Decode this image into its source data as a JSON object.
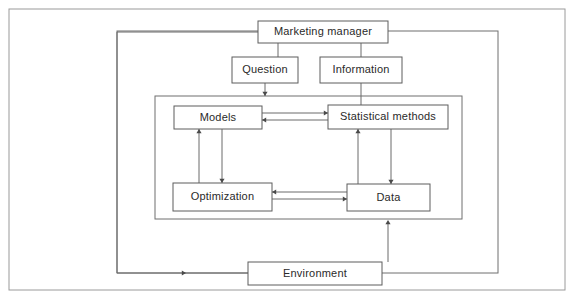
{
  "diagram": {
    "type": "flow-diagram",
    "colors": {
      "background": "#ffffff",
      "page_border": "#9a9a9a",
      "group_border": "#6f6f6f",
      "node_border": "#5c5c5c",
      "node_fill": "#ffffff",
      "line": "#6b6b6b",
      "text": "#2a2a2a"
    },
    "page_frame": {
      "x": 9,
      "y": 9,
      "width": 556,
      "height": 281
    },
    "groups": [
      {
        "name": "system-boundary",
        "label": "",
        "x": 117,
        "y": 31,
        "width": 381,
        "height": 242
      },
      {
        "name": "analysis-core",
        "label": "",
        "x": 155,
        "y": 96,
        "width": 307,
        "height": 123
      }
    ],
    "nodes": [
      {
        "id": "marketing-manager",
        "label": "Marketing manager",
        "x": 258,
        "y": 21,
        "width": 130,
        "height": 22
      },
      {
        "id": "question",
        "label": "Question",
        "x": 232,
        "y": 57,
        "width": 66,
        "height": 26
      },
      {
        "id": "information",
        "label": "Information",
        "x": 320,
        "y": 57,
        "width": 82,
        "height": 26
      },
      {
        "id": "models",
        "label": "Models",
        "x": 174,
        "y": 106,
        "width": 88,
        "height": 23
      },
      {
        "id": "statistical-methods",
        "label": "Statistical methods",
        "x": 328,
        "y": 105,
        "width": 120,
        "height": 24
      },
      {
        "id": "optimization",
        "label": "Optimization",
        "x": 173,
        "y": 183,
        "width": 99,
        "height": 28
      },
      {
        "id": "data",
        "label": "Data",
        "x": 347,
        "y": 184,
        "width": 83,
        "height": 27
      },
      {
        "id": "environment",
        "label": "Environment",
        "x": 248,
        "y": 262,
        "width": 134,
        "height": 23
      }
    ],
    "connections": [
      {
        "id": "manager-to-question",
        "from": "marketing-manager",
        "to": "question",
        "points": "278,43 278,57",
        "arrow": null
      },
      {
        "id": "manager-to-information",
        "from": "marketing-manager",
        "to": "information",
        "points": "361,43 361,57",
        "arrow": null
      },
      {
        "id": "question-to-core",
        "from": "question",
        "to": "analysis-core",
        "points": "265,83 265,96",
        "arrow": {
          "x": 265,
          "y": 96,
          "dir": "down"
        }
      },
      {
        "id": "information-to-statistical-methods",
        "from": "information",
        "to": "statistical-methods",
        "points": "361,83 361,105",
        "arrow": null
      },
      {
        "id": "models-to-statistical-methods",
        "from": "models",
        "to": "statistical-methods",
        "points": "262,113 328,113",
        "arrow": {
          "x": 328,
          "y": 113,
          "dir": "right"
        }
      },
      {
        "id": "statistical-methods-to-models",
        "from": "statistical-methods",
        "to": "models",
        "points": "328,120 262,120",
        "arrow": {
          "x": 262,
          "y": 120,
          "dir": "left"
        }
      },
      {
        "id": "optimization-to-models",
        "from": "optimization",
        "to": "models",
        "points": "199,183 199,129",
        "arrow": {
          "x": 199,
          "y": 129,
          "dir": "up"
        }
      },
      {
        "id": "models-to-optimization",
        "from": "models",
        "to": "optimization",
        "points": "222,129 222,183",
        "arrow": {
          "x": 222,
          "y": 183,
          "dir": "down"
        }
      },
      {
        "id": "data-to-statistical-methods",
        "from": "data",
        "to": "statistical-methods",
        "points": "358,184 358,129",
        "arrow": {
          "x": 358,
          "y": 129,
          "dir": "up"
        }
      },
      {
        "id": "statistical-methods-to-data",
        "from": "statistical-methods",
        "to": "data",
        "points": "391,129 391,184",
        "arrow": {
          "x": 391,
          "y": 184,
          "dir": "down"
        }
      },
      {
        "id": "data-to-optimization",
        "from": "data",
        "to": "optimization",
        "points": "347,192 272,192",
        "arrow": {
          "x": 272,
          "y": 192,
          "dir": "left"
        }
      },
      {
        "id": "optimization-to-data",
        "from": "optimization",
        "to": "data",
        "points": "272,199 347,199",
        "arrow": {
          "x": 347,
          "y": 199,
          "dir": "right"
        }
      },
      {
        "id": "environment-to-core",
        "from": "environment",
        "to": "analysis-core",
        "points": "388,262 388,222",
        "arrow": {
          "x": 388,
          "y": 220,
          "dir": "up"
        }
      },
      {
        "id": "manager-to-environment",
        "from": "marketing-manager",
        "to": "environment",
        "points": "258,32 117,32 117,273 248,273",
        "arrow": {
          "x": 186,
          "y": 273,
          "dir": "right"
        }
      }
    ]
  }
}
